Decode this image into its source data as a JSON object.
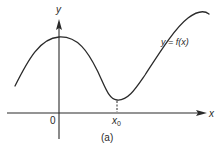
{
  "figure": {
    "caption": "(a)",
    "curve_label": "y = f(x)",
    "axes": {
      "y_label": "y",
      "x_label": "x",
      "origin_label": "0",
      "marked_point": {
        "label_base": "x",
        "label_sub": "0",
        "description": "local minimum location"
      }
    },
    "colors": {
      "ink": "#2a2a2a",
      "background": "#ffffff"
    }
  }
}
